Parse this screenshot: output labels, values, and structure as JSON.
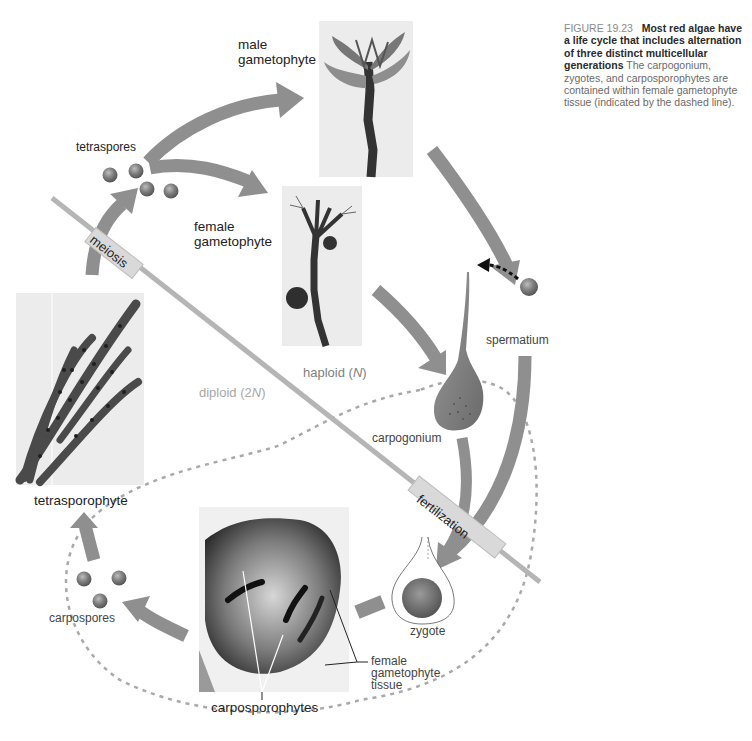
{
  "figure": {
    "number": "FIGURE 19.23",
    "title": "Most red algae have a life cycle that includes alternation of three distinct multicellular generations",
    "body": "The carpogonium, zygotes, and carposporophytes are contained within female gametophyte tissue (indicated by the dashed line)."
  },
  "labels": {
    "male_gametophyte": "male\ngametophyte",
    "female_gametophyte": "female\ngametophyte",
    "tetraspores": "tetraspores",
    "meiosis": "meiosis",
    "fertilization": "fertilization",
    "spermatium": "spermatium",
    "carpogonium": "carpogonium",
    "haploid": "haploid (",
    "haploid_n": "N",
    "diploid": "diploid (2",
    "diploid_n": "N",
    "close_paren": ")",
    "tetrasporophyte": "tetrasporophyte",
    "carpospores": "carpospores",
    "zygote": "zygote",
    "carposporophytes": "carposporophytes",
    "female_gametophyte_tissue": "female\ngametophyte\ntissue"
  },
  "colors": {
    "arrow": "#8f8f8f",
    "divider": "#b5b5b5",
    "dashed_boundary": "#a9a9a9",
    "spore": "#7d7d7d",
    "photo_bg": "#ececec",
    "alga_dark": "#3a3a3a"
  }
}
